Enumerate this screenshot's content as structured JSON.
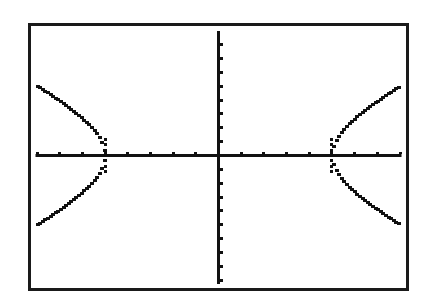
{
  "chart_data": {
    "type": "line",
    "title": "",
    "subtitle": "",
    "xlabel": "",
    "ylabel": "",
    "equation": "x^2/25 - y^2/16 = 1",
    "xlim": [
      -8,
      8
    ],
    "ylim": [
      -9,
      9
    ],
    "xscl": 1,
    "yscl": 1,
    "grid": false,
    "legend": null,
    "axes": {
      "show": true,
      "x_ticks_each_side": 8,
      "y_ticks_each_side": 9
    },
    "series": [
      {
        "name": "left-upper-branch",
        "x": [
          -8,
          -7.5,
          -7,
          -6.5,
          -6,
          -5.5,
          -5.2,
          -5
        ],
        "y": [
          4.99,
          4.47,
          3.92,
          3.32,
          2.65,
          1.83,
          1.14,
          0
        ]
      },
      {
        "name": "left-lower-branch",
        "x": [
          -8,
          -7.5,
          -7,
          -6.5,
          -6,
          -5.5,
          -5.2,
          -5
        ],
        "y": [
          -4.99,
          -4.47,
          -3.92,
          -3.32,
          -2.65,
          -1.83,
          -1.14,
          0
        ]
      },
      {
        "name": "right-upper-branch",
        "x": [
          5,
          5.2,
          5.5,
          6,
          6.5,
          7,
          7.5,
          8
        ],
        "y": [
          0,
          1.14,
          1.83,
          2.65,
          3.32,
          3.92,
          4.47,
          4.99
        ]
      },
      {
        "name": "right-lower-branch",
        "x": [
          5,
          5.2,
          5.5,
          6,
          6.5,
          7,
          7.5,
          8
        ],
        "y": [
          0,
          -1.14,
          -1.83,
          -2.65,
          -3.32,
          -3.92,
          -4.47,
          -4.99
        ]
      }
    ]
  },
  "screen": {
    "frame_color": "#1a1a1a",
    "background": "#ffffff",
    "ink_color": "#111111"
  }
}
